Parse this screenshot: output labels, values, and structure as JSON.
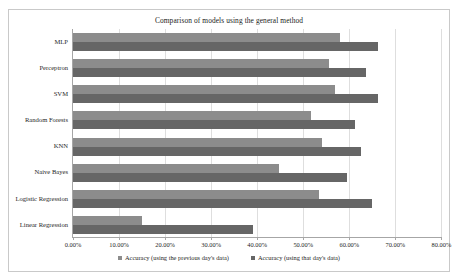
{
  "chart_data": {
    "type": "bar",
    "orientation": "horizontal",
    "title": "Comparison of models using the general method",
    "xlabel": "",
    "ylabel": "",
    "xlim": [
      0,
      80
    ],
    "xtick_labels": [
      "0.00%",
      "10.00%",
      "20.00%",
      "30.00%",
      "40.00%",
      "50.00%",
      "60.00%",
      "70.00%",
      "80.00%"
    ],
    "xtick_values": [
      0,
      10,
      20,
      30,
      40,
      50,
      60,
      70,
      80
    ],
    "grid": true,
    "legend_position": "bottom",
    "categories": [
      "MLP",
      "Perceptron",
      "SVM",
      "Random Forests",
      "KNN",
      "Naive Bayes",
      "Logistic Regression",
      "Linear Regression"
    ],
    "series": [
      {
        "name": "Accuracy (using the previous day's data)",
        "color": "#8c8c8c",
        "values": [
          57.9,
          55.5,
          57.0,
          51.6,
          54.1,
          44.8,
          53.4,
          15.0
        ]
      },
      {
        "name": "Accuracy (using that day's data)",
        "color": "#666666",
        "values": [
          66.2,
          63.6,
          66.2,
          61.2,
          62.6,
          59.4,
          64.9,
          39.1
        ]
      }
    ]
  },
  "colors": {
    "series_prev": "#8c8c8c",
    "series_that": "#666666",
    "gridline": "#dedede",
    "axis": "#a6a6a6",
    "frame_border": "#c9c9c9",
    "background": "#ffffff"
  }
}
